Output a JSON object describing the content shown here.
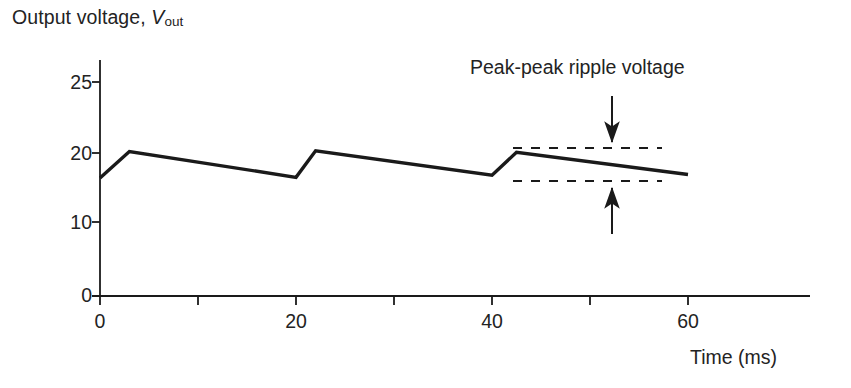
{
  "figure": {
    "ylabel_prefix": "Output voltage, ",
    "ylabel_var": "V",
    "ylabel_sub": "out",
    "xlabel": "Time (ms)",
    "annotation": "Peak-peak ripple voltage"
  },
  "chart_data": {
    "type": "line",
    "title": "",
    "xlabel": "Time (ms)",
    "ylabel": "Output voltage, Vout",
    "xlim": [
      0,
      66
    ],
    "ylim": [
      0,
      27
    ],
    "xticks": [
      0,
      20,
      40,
      60
    ],
    "xtick_labels": [
      "0",
      "20",
      "40",
      "60"
    ],
    "yticks": [
      0,
      10,
      20,
      25
    ],
    "ytick_labels": [
      "0",
      "10",
      "20",
      "25"
    ],
    "grid": false,
    "legend": null,
    "series": [
      {
        "name": "Output voltage (rectified, smoothed)",
        "x": [
          0,
          3,
          20,
          22,
          40,
          42.5,
          60
        ],
        "y": [
          16.5,
          20.2,
          16.6,
          20.3,
          16.9,
          20.1,
          17.0
        ]
      }
    ],
    "annotations": [
      {
        "name": "peak-peak-ripple",
        "text": "Peak-peak ripple voltage",
        "upper_level": 20.5,
        "lower_level": 16.8,
        "span_x": [
          38.5,
          52.5
        ]
      }
    ]
  },
  "ticks": {
    "y": [
      {
        "label": "25",
        "value": 25
      },
      {
        "label": "20",
        "value": 20
      },
      {
        "label": "10",
        "value": 10
      },
      {
        "label": "0",
        "value": 0
      }
    ],
    "x": [
      {
        "label": "0",
        "value": 0
      },
      {
        "label": "20",
        "value": 20
      },
      {
        "label": "40",
        "value": 40
      },
      {
        "label": "60",
        "value": 60
      }
    ]
  },
  "colors": {
    "ink": "#1a1a1a",
    "text": "#232323",
    "background": "#ffffff"
  }
}
